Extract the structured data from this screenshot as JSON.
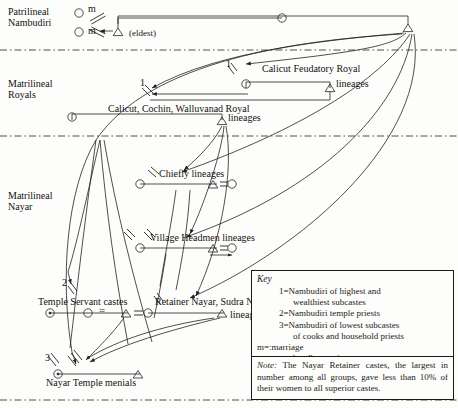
{
  "figure": {
    "type": "kinship-diagram"
  },
  "sections": [
    {
      "id": "patrilineal-nambudiri",
      "line1": "Patrilineal",
      "line2": "Nambudiri",
      "x": 8,
      "y": 8
    },
    {
      "id": "matrilineal-royals",
      "line1": "Matrilineal",
      "line2": "Royals",
      "x": 8,
      "y": 80
    },
    {
      "id": "matrilineal-nayar",
      "line1": "Matrilineal",
      "line2": "Nayar",
      "x": 8,
      "y": 190
    }
  ],
  "dividers": [
    {
      "id": "divider-1",
      "y": 50
    },
    {
      "id": "divider-2",
      "y": 136
    },
    {
      "id": "divider-3",
      "y": 400
    }
  ],
  "node_labels": {
    "m_top": "m",
    "m_bottom": "m",
    "eldest": "(eldest)",
    "calicut_feudatory_line1": "Calicut Feudatory Royal",
    "calicut_feudatory_line2": "lineages",
    "calicut_cochin_line1": "Calicut, Cochin, Walluvanad Royal",
    "calicut_cochin_line2": "lineages",
    "chiefly": "Chiefly lineages",
    "village_headmen": "Village Headmen lineages",
    "temple_servant": "Temple Servant castes",
    "retainer_nayar_line1": "Retainer Nayar, Sudra Nayar",
    "retainer_nayar_line2": "lineages",
    "nayar_temple_menials": "Nayar Temple menials"
  },
  "number_labels": [
    {
      "id": "num-1-royals-left",
      "text": "1",
      "x": 140,
      "y": 77
    },
    {
      "id": "num-1-royals-right",
      "text": "1",
      "x": 226,
      "y": 58
    },
    {
      "id": "num-2-temple-servant",
      "text": "2",
      "x": 62,
      "y": 277
    },
    {
      "id": "num-3-temple-menials",
      "text": "3",
      "x": 45,
      "y": 352
    }
  ],
  "equals_marks": [
    {
      "id": "eq-chiefly",
      "x": 219,
      "y": 179
    },
    {
      "id": "eq-village",
      "x": 219,
      "y": 243
    },
    {
      "id": "eq-temple-servant-mid",
      "x": 101,
      "y": 308
    },
    {
      "id": "eq-temple-servant-right",
      "x": 134,
      "y": 308
    }
  ],
  "key": {
    "title": "Key",
    "entries": [
      {
        "id": "key-1",
        "line1": "1=Nambudiri of highest and",
        "line2": "wealthiest subcastes"
      },
      {
        "id": "key-2",
        "line1": "2=Nambudiri temple priests",
        "line2": ""
      },
      {
        "id": "key-3",
        "line1": "3=Nambudiri of lowest subcastes",
        "line2": "of cooks and household priests"
      }
    ],
    "symbols": [
      {
        "id": "key-marriage",
        "text": "m=:marriage"
      },
      {
        "id": "key-sambandham",
        "text": "=:sambandham union"
      }
    ]
  },
  "note": {
    "label": "Note:",
    "text": "The Nayar Retainer castes, the largest in number among all groups, gave less than 10% of their women to all superior castes."
  },
  "colors": {
    "ink": "#1a1a1a",
    "paper": "#fdfdfb",
    "line": "#222222"
  }
}
